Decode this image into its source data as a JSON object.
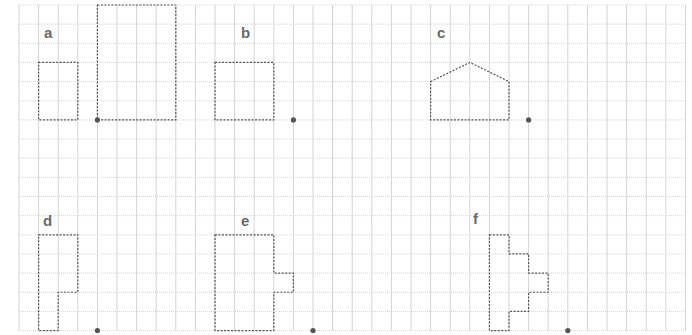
{
  "grid": {
    "x0": 19,
    "y0": 5,
    "cell_w": 19.6,
    "cell_h": 19.15,
    "cols": 34,
    "rows": 17,
    "line_color": "#d4d4d4",
    "edge_color": "#cfcfcf"
  },
  "style": {
    "shape_stroke": "#555555",
    "dot_color": "#555555"
  },
  "figures": [
    {
      "label": "a",
      "label_pos": [
        44,
        25
      ],
      "shapes": [
        [
          [
            1,
            3
          ],
          [
            3,
            3
          ],
          [
            3,
            6
          ],
          [
            1,
            6
          ]
        ],
        [
          [
            4,
            0
          ],
          [
            8,
            0
          ],
          [
            8,
            6
          ],
          [
            4,
            6
          ]
        ]
      ],
      "dot": [
        4,
        6
      ]
    },
    {
      "label": "b",
      "label_pos": [
        241,
        25
      ],
      "shapes": [
        [
          [
            10,
            3
          ],
          [
            13,
            3
          ],
          [
            13,
            6
          ],
          [
            10,
            6
          ]
        ]
      ],
      "dot": [
        14,
        6
      ]
    },
    {
      "label": "c",
      "label_pos": [
        437,
        25
      ],
      "shapes": [
        [
          [
            21,
            4
          ],
          [
            23,
            3
          ],
          [
            25,
            4
          ],
          [
            25,
            6
          ],
          [
            21,
            6
          ]
        ]
      ],
      "dot": [
        26,
        6
      ]
    },
    {
      "label": "d",
      "label_pos": [
        43,
        213
      ],
      "shapes": [
        [
          [
            1,
            12
          ],
          [
            3,
            12
          ],
          [
            3,
            15
          ],
          [
            2,
            15
          ],
          [
            2,
            17
          ],
          [
            1,
            17
          ]
        ]
      ],
      "dot": [
        4,
        17
      ]
    },
    {
      "label": "e",
      "label_pos": [
        241,
        213
      ],
      "shapes": [
        [
          [
            10,
            12
          ],
          [
            13,
            12
          ],
          [
            13,
            14
          ],
          [
            14,
            14
          ],
          [
            14,
            15
          ],
          [
            13,
            15
          ],
          [
            13,
            17
          ],
          [
            10,
            17
          ]
        ]
      ],
      "dot": [
        15,
        17
      ]
    },
    {
      "label": "f",
      "label_pos": [
        473,
        211
      ],
      "shapes": [
        [
          [
            24,
            12
          ],
          [
            25,
            12
          ],
          [
            25,
            13
          ],
          [
            26,
            13
          ],
          [
            26,
            14
          ],
          [
            27,
            14
          ],
          [
            27,
            15
          ],
          [
            26,
            15
          ],
          [
            26,
            16
          ],
          [
            25,
            16
          ],
          [
            25,
            17
          ],
          [
            24,
            17
          ]
        ]
      ],
      "dot": [
        28,
        17
      ]
    }
  ]
}
